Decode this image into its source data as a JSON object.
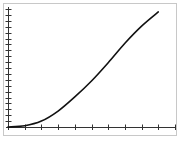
{
  "chart_data": {
    "type": "line",
    "title": "",
    "xlabel": "",
    "ylabel": "",
    "grid": false,
    "legend": null,
    "x_ticks": 10,
    "y_ticks": 20,
    "xlim": [
      0,
      10
    ],
    "ylim": [
      0,
      20
    ],
    "series": [
      {
        "name": "curve",
        "color": "#111111",
        "x": [
          0,
          1,
          2,
          3,
          4,
          5,
          6,
          7,
          8,
          9
        ],
        "values": [
          0,
          0.2,
          1.0,
          2.7,
          5.1,
          7.8,
          10.9,
          14.2,
          17.1,
          19.5
        ]
      }
    ]
  },
  "style": {
    "axis_color": "#333333",
    "frame_color": "#c8c8c8",
    "line_color": "#111111"
  }
}
